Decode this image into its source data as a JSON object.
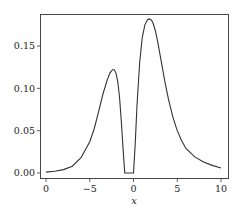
{
  "chart_data": {
    "type": "line",
    "title": "",
    "xlabel": "x",
    "ylabel": "",
    "xlim": [
      -10.5,
      10.5
    ],
    "ylim": [
      -0.008,
      0.189
    ],
    "x_ticks": [
      {
        "value": -10,
        "label": "0"
      },
      {
        "value": -5,
        "label": "−5"
      },
      {
        "value": 0,
        "label": "0"
      },
      {
        "value": 5,
        "label": "5"
      },
      {
        "value": 10,
        "label": "10"
      }
    ],
    "y_ticks": [
      {
        "value": 0.0,
        "label": "0.00"
      },
      {
        "value": 0.05,
        "label": "0.05"
      },
      {
        "value": 0.1,
        "label": "0.10"
      },
      {
        "value": 0.15,
        "label": "0.15"
      }
    ],
    "grid": false,
    "series": [
      {
        "name": "curve",
        "color": "#333333",
        "x": [
          -10,
          -9,
          -8,
          -7,
          -6,
          -5,
          -4.5,
          -4,
          -3.5,
          -3,
          -2.7,
          -2.4,
          -2.2,
          -2.0,
          -1.8,
          -1.6,
          -1.4,
          -1.2,
          -1.0,
          -0.8,
          -0.5,
          -0.2,
          0.0,
          0.2,
          0.4,
          0.7,
          1.0,
          1.3,
          1.6,
          1.8,
          2.0,
          2.2,
          2.5,
          2.8,
          3.2,
          3.6,
          4.0,
          4.5,
          5.0,
          5.5,
          6.0,
          7.0,
          8.0,
          9.0,
          10.0
        ],
        "y": [
          0.001,
          0.002,
          0.004,
          0.008,
          0.018,
          0.037,
          0.052,
          0.072,
          0.093,
          0.11,
          0.118,
          0.122,
          0.122,
          0.118,
          0.108,
          0.09,
          0.062,
          0.03,
          0.0,
          0.0,
          0.0,
          0.0,
          0.0,
          0.035,
          0.08,
          0.13,
          0.16,
          0.175,
          0.181,
          0.182,
          0.181,
          0.178,
          0.168,
          0.153,
          0.13,
          0.107,
          0.087,
          0.066,
          0.05,
          0.038,
          0.029,
          0.019,
          0.013,
          0.009,
          0.006
        ]
      }
    ]
  }
}
